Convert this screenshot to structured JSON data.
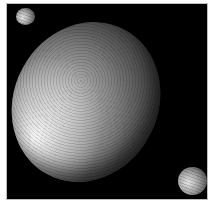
{
  "scene": {
    "subject": "dwarf planet with two moons",
    "background_color": "#000000",
    "page_color": "#ffffff",
    "objects": [
      {
        "name": "elongated-dwarf-planet",
        "shape": "ellipsoid",
        "tint": "#9a9a9a"
      },
      {
        "name": "small-moon-top-left",
        "shape": "sphere",
        "tint": "#8a8a8a"
      },
      {
        "name": "moon-bottom-right",
        "shape": "sphere",
        "tint": "#a0a0a0"
      }
    ]
  }
}
